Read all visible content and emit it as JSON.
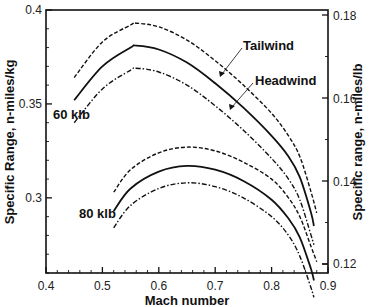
{
  "chart_data": {
    "type": "line",
    "title": "",
    "xlabel": "Mach number",
    "ylabel": "Specific Range, n-miles/kg",
    "ylabel_right": "Specific range, n-miles/lb",
    "xlim": [
      0.4,
      0.9
    ],
    "ylim": [
      0.26,
      0.4
    ],
    "ylim_right": [
      0.1195,
      0.1812
    ],
    "x_ticks": [
      "0.4",
      "0.5",
      "0.6",
      "0.7",
      "0.8",
      "0.9"
    ],
    "y_ticks": [
      "0.3",
      "0.35",
      "0.4"
    ],
    "y_ticks_right": [
      "0.12",
      "0.14",
      "0.16",
      "0.18"
    ],
    "grid": false,
    "annotations": [
      {
        "text": "Tailwind",
        "points_to": "60 klb tailwind (dashed)"
      },
      {
        "text": "Headwind",
        "points_to": "60 klb headwind (dash-dot)"
      },
      {
        "text": "60 klb",
        "labels": "upper group"
      },
      {
        "text": "80 klb",
        "labels": "lower group"
      }
    ],
    "series": [
      {
        "name": "60 klb tailwind",
        "style": "dashed",
        "x": [
          0.45,
          0.5,
          0.55,
          0.56,
          0.6,
          0.65,
          0.7,
          0.75,
          0.8,
          0.83,
          0.85,
          0.87,
          0.88
        ],
        "values": [
          0.364,
          0.383,
          0.392,
          0.393,
          0.391,
          0.384,
          0.373,
          0.36,
          0.345,
          0.333,
          0.322,
          0.303,
          0.292
        ]
      },
      {
        "name": "60 klb no wind",
        "style": "solid",
        "x": [
          0.45,
          0.5,
          0.55,
          0.56,
          0.6,
          0.65,
          0.7,
          0.75,
          0.8,
          0.83,
          0.85,
          0.87,
          0.875
        ],
        "values": [
          0.352,
          0.37,
          0.38,
          0.381,
          0.379,
          0.372,
          0.361,
          0.348,
          0.333,
          0.322,
          0.311,
          0.292,
          0.285
        ]
      },
      {
        "name": "60 klb headwind",
        "style": "dashdot",
        "x": [
          0.45,
          0.5,
          0.55,
          0.56,
          0.6,
          0.65,
          0.7,
          0.75,
          0.8,
          0.83,
          0.85,
          0.87,
          0.875
        ],
        "values": [
          0.34,
          0.358,
          0.368,
          0.369,
          0.367,
          0.36,
          0.349,
          0.336,
          0.321,
          0.31,
          0.299,
          0.28,
          0.275
        ]
      },
      {
        "name": "80 klb tailwind",
        "style": "dashed",
        "x": [
          0.52,
          0.55,
          0.6,
          0.65,
          0.7,
          0.75,
          0.8,
          0.83,
          0.85,
          0.87,
          0.88
        ],
        "values": [
          0.303,
          0.315,
          0.324,
          0.327,
          0.325,
          0.319,
          0.31,
          0.3,
          0.29,
          0.274,
          0.266
        ]
      },
      {
        "name": "80 klb no wind",
        "style": "solid",
        "x": [
          0.52,
          0.55,
          0.6,
          0.65,
          0.7,
          0.75,
          0.8,
          0.83,
          0.85,
          0.87,
          0.875
        ],
        "values": [
          0.293,
          0.305,
          0.314,
          0.317,
          0.315,
          0.309,
          0.299,
          0.289,
          0.279,
          0.262,
          0.256
        ]
      },
      {
        "name": "80 klb headwind",
        "style": "dashdot",
        "x": [
          0.52,
          0.55,
          0.6,
          0.65,
          0.7,
          0.75,
          0.8,
          0.83,
          0.85,
          0.87,
          0.875
        ],
        "values": [
          0.284,
          0.296,
          0.305,
          0.308,
          0.306,
          0.3,
          0.29,
          0.28,
          0.269,
          0.252,
          0.247
        ]
      }
    ]
  },
  "labels": {
    "xlabel": "Mach number",
    "ylabel": "Specific Range, n-miles/kg",
    "ylabel_right": "Specific range, n-miles/lb",
    "tailwind": "Tailwind",
    "headwind": "Headwind",
    "weight_60": "60 klb",
    "weight_80": "80 klb",
    "x_ticks": [
      "0.4",
      "0.5",
      "0.6",
      "0.7",
      "0.8",
      "0.9"
    ],
    "y_ticks": [
      "0.3",
      "0.35",
      "0.4"
    ],
    "y_ticks_right": [
      "0.12",
      "0.14",
      "0.16",
      "0.18"
    ]
  }
}
